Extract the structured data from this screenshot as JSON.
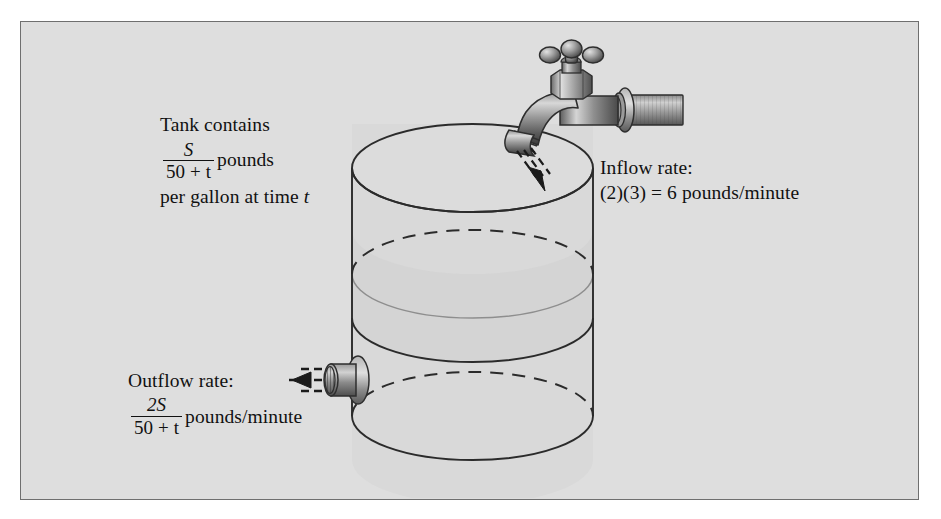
{
  "figure": {
    "kind": "mixing-tank-diagram",
    "background_color": "#dedede",
    "border_color": "#6f6f6f",
    "outside_color": "#ffffff",
    "ink_color": "#111111"
  },
  "labels": {
    "tank_contains": {
      "name": "tank-contains-label",
      "line1": "Tank contains",
      "fraction_numerator": "S",
      "fraction_denominator": "50 + t",
      "unit_after_fraction": "pounds",
      "line3": "per gallon at time t",
      "line3_plain": "per gallon at time",
      "line3_variable": "t"
    },
    "inflow": {
      "name": "inflow-rate-label",
      "line1": "Inflow rate:",
      "line2": "(2)(3) = 6 pounds/minute",
      "expression": "(2)(3)",
      "equals": "=",
      "value": "6",
      "units": "pounds/minute"
    },
    "outflow": {
      "name": "outflow-rate-label",
      "line1": "Outflow rate:",
      "fraction_numerator": "2S",
      "fraction_denominator": "50 + t",
      "units": "pounds/minute"
    }
  },
  "tank": {
    "name": "cylindrical-tank",
    "left_x": 352,
    "right_x": 593,
    "top_y": 124,
    "bottom_y": 460,
    "ellipse_ry": 44,
    "water_level_y": 274,
    "mid_band_y": 318,
    "outline_color": "#2b2b2b",
    "fill_color": "#d8d8d8",
    "band_fill_color": "#d2d2d2"
  },
  "faucet": {
    "name": "inflow-faucet",
    "handle_shape": "cross-handle",
    "body_color_dark": "#4a4a4a",
    "body_color_light": "#c9c9c9",
    "stream_arrow": "dashed-arrow-down-left",
    "stream_count": 3
  },
  "outlet": {
    "name": "outflow-spigot",
    "position": "tank-lower-left",
    "stream_arrow": "dashed-arrow-left",
    "stream_count": 3
  }
}
